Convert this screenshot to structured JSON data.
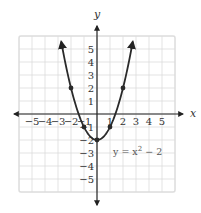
{
  "chart_data": {
    "type": "line",
    "title": "",
    "equation_label": "y = x² − 2",
    "equation": {
      "prefix": "y = x",
      "exponent": "2",
      "suffix": " − 2"
    },
    "xlabel": "x",
    "ylabel": "y",
    "xlim": [
      -6,
      6
    ],
    "ylim": [
      -6,
      6
    ],
    "grid": true,
    "x_ticks": [
      -5,
      -4,
      -3,
      -2,
      -1,
      1,
      2,
      3,
      4,
      5
    ],
    "y_ticks": [
      -5,
      -4,
      -3,
      -2,
      -1,
      1,
      2,
      3,
      4,
      5
    ],
    "x_tick_labels": [
      "−5",
      "−4",
      "−3",
      "−2",
      "−1",
      "1",
      "2",
      "3",
      "4",
      "5"
    ],
    "y_tick_labels": [
      "−5",
      "−4",
      "−3",
      "−2",
      "−1",
      "1",
      "2",
      "3",
      "4",
      "5"
    ],
    "series": [
      {
        "name": "y = x^2 - 2",
        "function": "x^2 - 2",
        "domain": [
          -2.75,
          2.75
        ],
        "arrows": "both ends",
        "points": [
          {
            "x": -2,
            "y": 2
          },
          {
            "x": -1,
            "y": -1
          },
          {
            "x": 0,
            "y": -2
          },
          {
            "x": 1,
            "y": -1
          },
          {
            "x": 2,
            "y": 2
          }
        ]
      }
    ]
  }
}
